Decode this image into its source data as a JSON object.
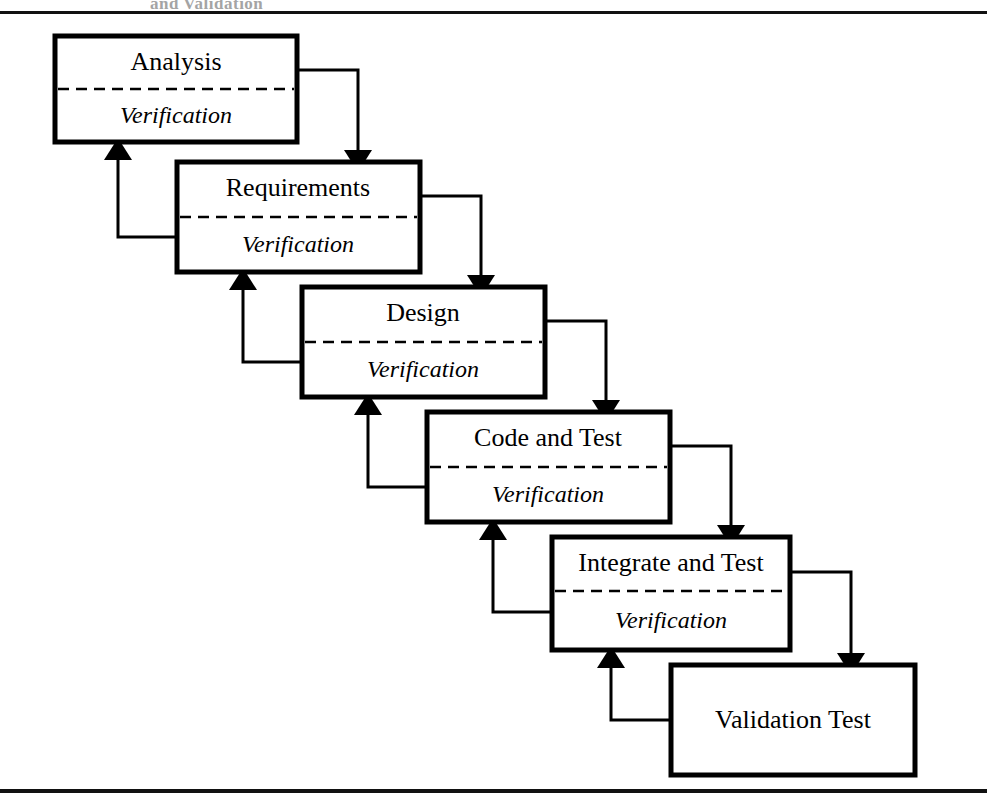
{
  "page": {
    "header_fragment": "and Validation",
    "background_color": "#ffffff",
    "ink_color": "#000000"
  },
  "diagram": {
    "type": "waterfall-lifecycle-flow",
    "verification_label": "Verification",
    "boxes": [
      {
        "id": "analysis",
        "title": "Analysis",
        "sub": "Verification",
        "has_divider": true,
        "x": 55,
        "y": 36,
        "w": 242,
        "h": 106
      },
      {
        "id": "requirements",
        "title": "Requirements",
        "sub": "Verification",
        "has_divider": true,
        "x": 177,
        "y": 162,
        "w": 243,
        "h": 110
      },
      {
        "id": "design",
        "title": "Design",
        "sub": "Verification",
        "has_divider": true,
        "x": 302,
        "y": 287,
        "w": 243,
        "h": 110
      },
      {
        "id": "code-and-test",
        "title": "Code and Test",
        "sub": "Verification",
        "has_divider": true,
        "x": 427,
        "y": 412,
        "w": 243,
        "h": 110
      },
      {
        "id": "integrate-and-test",
        "title": "Integrate and Test",
        "sub": "Verification",
        "has_divider": true,
        "x": 552,
        "y": 537,
        "w": 238,
        "h": 113
      },
      {
        "id": "validation-test",
        "title": "Validation Test",
        "sub": "",
        "has_divider": false,
        "x": 671,
        "y": 665,
        "w": 244,
        "h": 110
      }
    ],
    "forward_flows": [
      {
        "from": "analysis",
        "to": "requirements"
      },
      {
        "from": "requirements",
        "to": "design"
      },
      {
        "from": "design",
        "to": "code-and-test"
      },
      {
        "from": "code-and-test",
        "to": "integrate-and-test"
      },
      {
        "from": "integrate-and-test",
        "to": "validation-test"
      }
    ],
    "feedback_flows": [
      {
        "from": "requirements",
        "to": "analysis"
      },
      {
        "from": "design",
        "to": "requirements"
      },
      {
        "from": "code-and-test",
        "to": "design"
      },
      {
        "from": "integrate-and-test",
        "to": "code-and-test"
      },
      {
        "from": "validation-test",
        "to": "integrate-and-test"
      }
    ]
  }
}
